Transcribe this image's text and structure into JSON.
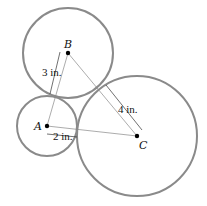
{
  "diagram": {
    "type": "three mutually tangent circles",
    "circles": [
      {
        "id": "A",
        "label": "A",
        "cx": 47,
        "cy": 126,
        "r": 30
      },
      {
        "id": "B",
        "label": "B",
        "cx": 68,
        "cy": 53,
        "r": 45
      },
      {
        "id": "C",
        "label": "C",
        "cx": 137,
        "cy": 136,
        "r": 60
      }
    ],
    "dimensions": [
      {
        "id": "radius-a",
        "text": "2 in."
      },
      {
        "id": "radius-b",
        "text": "3 in."
      },
      {
        "id": "radius-c",
        "text": "4 in."
      }
    ],
    "colors": {
      "circle_stroke": "#8a8a8a",
      "line": "#777777",
      "point": "#000000"
    }
  }
}
